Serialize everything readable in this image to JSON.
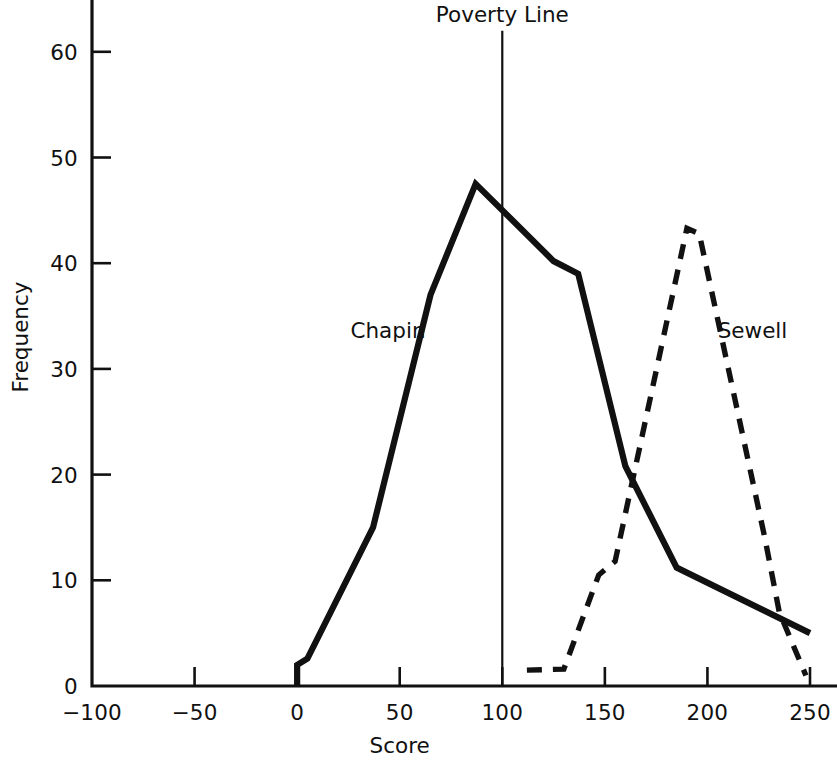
{
  "chart_data": {
    "type": "line",
    "title": "",
    "xlabel": "Score",
    "ylabel": "Frequency",
    "xlim": [
      -100,
      250
    ],
    "ylim": [
      0,
      65
    ],
    "grid": false,
    "legend_position": "inline-annotations",
    "xticks": [
      -100,
      -50,
      0,
      50,
      100,
      150,
      200,
      250
    ],
    "xtick_labels": [
      "−100",
      "−50",
      "0",
      "50",
      "100",
      "150",
      "200",
      "250"
    ],
    "yticks": [
      0,
      10,
      20,
      30,
      40,
      50,
      60
    ],
    "ytick_labels": [
      "0",
      "10",
      "20",
      "30",
      "40",
      "50",
      "60"
    ],
    "series": [
      {
        "name": "Chapin",
        "style": "solid",
        "color": "#111111",
        "points": [
          [
            0,
            0
          ],
          [
            0,
            2.0
          ],
          [
            5,
            2.6
          ],
          [
            37,
            15.0
          ],
          [
            65,
            37.0
          ],
          [
            87,
            47.5
          ],
          [
            125,
            40.2
          ],
          [
            137,
            39.0
          ],
          [
            160,
            20.8
          ],
          [
            185,
            11.2
          ],
          [
            250,
            5.0
          ]
        ]
      },
      {
        "name": "Sewell",
        "style": "dashed",
        "color": "#111111",
        "points": [
          [
            112,
            1.5
          ],
          [
            130,
            1.6
          ],
          [
            147,
            10.5
          ],
          [
            155,
            11.8
          ],
          [
            190,
            43.3
          ],
          [
            196,
            42.8
          ],
          [
            228,
            14.0
          ],
          [
            235,
            7.0
          ],
          [
            248,
            1.0
          ]
        ]
      }
    ],
    "annotations": [
      {
        "name": "poverty-line",
        "label": "Poverty Line",
        "type": "vertical-line",
        "x": 100,
        "y_top": 62,
        "y_bottom": 0
      },
      {
        "name": "chapin-series-label",
        "label": "Chapin",
        "type": "text",
        "x": 26,
        "y": 33.6
      },
      {
        "name": "sewell-series-label",
        "label": "Sewell",
        "type": "text",
        "x": 205,
        "y": 33.6
      }
    ]
  }
}
